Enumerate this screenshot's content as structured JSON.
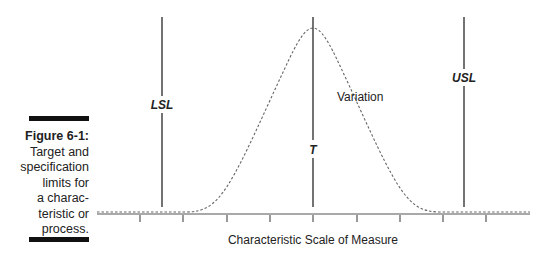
{
  "caption": {
    "title": "Figure 6-1:",
    "lines": [
      "Target and",
      "specification",
      "limits for",
      "a charac-",
      "teristic or",
      "process."
    ]
  },
  "diagram": {
    "lsl_label": "LSL",
    "target_label": "T",
    "usl_label": "USL",
    "variation_label": "Variation",
    "axis_label": "Characteristic Scale of Measure",
    "tick_count": 9
  }
}
